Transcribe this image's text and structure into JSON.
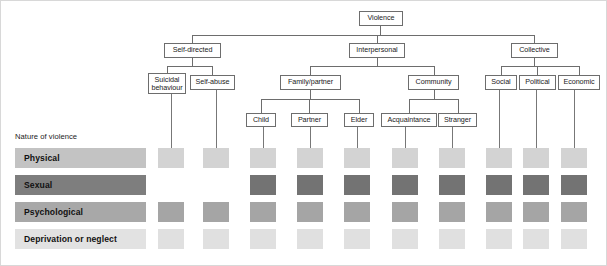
{
  "diagram": {
    "title_node": "Violence",
    "nature_label": "Nature of violence"
  },
  "tree": {
    "root": {
      "label": "Violence",
      "x": 358,
      "y": 10,
      "w": 44,
      "h": 15
    },
    "level1": [
      {
        "label": "Self-directed",
        "x": 163,
        "y": 42,
        "w": 57,
        "h": 15
      },
      {
        "label": "Interpersonal",
        "x": 348,
        "y": 42,
        "w": 56,
        "h": 15
      },
      {
        "label": "Collective",
        "x": 510,
        "y": 42,
        "w": 47,
        "h": 15
      }
    ],
    "level2": [
      {
        "label": "Suicidal\nbehaviour",
        "x": 147,
        "y": 72,
        "w": 38,
        "h": 21,
        "two_line": true
      },
      {
        "label": "Self-abuse",
        "x": 189,
        "y": 74,
        "w": 45,
        "h": 15
      },
      {
        "label": "Family/partner",
        "x": 279,
        "y": 74,
        "w": 61,
        "h": 15
      },
      {
        "label": "Community",
        "x": 407,
        "y": 74,
        "w": 51,
        "h": 15
      },
      {
        "label": "Social",
        "x": 484,
        "y": 74,
        "w": 32,
        "h": 15
      },
      {
        "label": "Political",
        "x": 518,
        "y": 74,
        "w": 37,
        "h": 15
      },
      {
        "label": "Economic",
        "x": 557,
        "y": 74,
        "w": 42,
        "h": 15
      }
    ],
    "level3": [
      {
        "label": "Child",
        "x": 245,
        "y": 112,
        "w": 30,
        "h": 14
      },
      {
        "label": "Partner",
        "x": 290,
        "y": 112,
        "w": 37,
        "h": 14
      },
      {
        "label": "Elder",
        "x": 343,
        "y": 112,
        "w": 30,
        "h": 14
      },
      {
        "label": "Acquaintance",
        "x": 380,
        "y": 112,
        "w": 56,
        "h": 14
      },
      {
        "label": "Stranger",
        "x": 437,
        "y": 112,
        "w": 39,
        "h": 14
      }
    ]
  },
  "matrix": {
    "columns": [
      {
        "name": "Suicidal behaviour",
        "x": 157
      },
      {
        "name": "Self-abuse",
        "x": 202
      },
      {
        "name": "Child",
        "x": 249
      },
      {
        "name": "Partner",
        "x": 296
      },
      {
        "name": "Elder",
        "x": 343
      },
      {
        "name": "Acquaintance",
        "x": 391
      },
      {
        "name": "Stranger",
        "x": 438
      },
      {
        "name": "Social",
        "x": 485
      },
      {
        "name": "Political",
        "x": 522
      },
      {
        "name": "Economic",
        "x": 560
      }
    ],
    "rows": [
      {
        "label": "Physical",
        "y": 147,
        "label_color": "#c3c3c3",
        "cell_color": "#d3d3d3",
        "cells": [
          true,
          true,
          true,
          true,
          true,
          true,
          true,
          true,
          true,
          true
        ]
      },
      {
        "label": "Sexual",
        "y": 174,
        "label_color": "#7e7e7e",
        "cell_color": "#737373",
        "cells": [
          false,
          false,
          true,
          true,
          true,
          true,
          true,
          true,
          true,
          true
        ]
      },
      {
        "label": "Psychological",
        "y": 201,
        "label_color": "#a8a8a8",
        "cell_color": "#a5a5a5",
        "cells": [
          true,
          true,
          true,
          true,
          true,
          true,
          true,
          true,
          true,
          true
        ]
      },
      {
        "label": "Deprivation or neglect",
        "y": 228,
        "label_color": "#e2e2e2",
        "cell_color": "#e0e0e0",
        "cells": [
          true,
          true,
          true,
          true,
          true,
          true,
          true,
          true,
          true,
          true
        ]
      }
    ]
  },
  "colors": {
    "line": "#6d6d6d",
    "text": "#1a1a1a",
    "background": "#ffffff"
  }
}
